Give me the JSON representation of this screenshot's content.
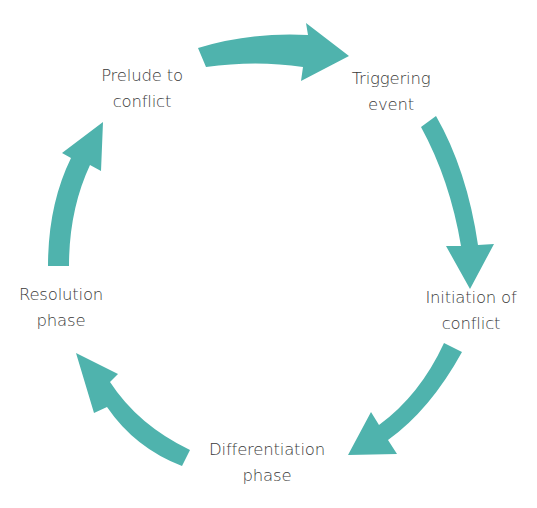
{
  "diagram": {
    "type": "cycle",
    "title": "",
    "arrow_color": "#4fb3ad",
    "text_color": "#3a3a3a",
    "stages": [
      {
        "id": "prelude",
        "line1": "Prelude to",
        "line2": "conflict"
      },
      {
        "id": "triggering",
        "line1": "Triggering",
        "line2": "event"
      },
      {
        "id": "initiation",
        "line1": "Initiation of",
        "line2": "conflict"
      },
      {
        "id": "differentiation",
        "line1": "Differentiation",
        "line2": "phase"
      },
      {
        "id": "resolution",
        "line1": "Resolution",
        "line2": "phase"
      }
    ],
    "arrows": [
      {
        "from": "prelude",
        "to": "triggering"
      },
      {
        "from": "triggering",
        "to": "initiation"
      },
      {
        "from": "initiation",
        "to": "differentiation"
      },
      {
        "from": "differentiation",
        "to": "resolution"
      },
      {
        "from": "resolution",
        "to": "prelude"
      }
    ]
  }
}
